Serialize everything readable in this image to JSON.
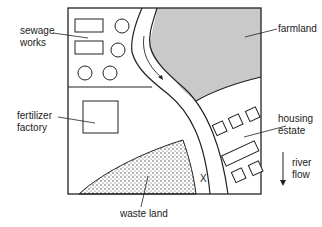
{
  "diagram": {
    "type": "map",
    "labels": {
      "sewage_works_1": "sewage",
      "sewage_works_2": "works",
      "farmland": "farmland",
      "fertilizer_factory_1": "fertilizer",
      "fertilizer_factory_2": "factory",
      "housing_estate_1": "housing",
      "housing_estate_2": "estate",
      "river_flow_1": "river",
      "river_flow_2": "flow",
      "waste_land": "waste land",
      "point_x": "X"
    },
    "colors": {
      "ink": "#222222",
      "farmland_fill": "#c9c9c9",
      "background": "#ffffff"
    }
  }
}
